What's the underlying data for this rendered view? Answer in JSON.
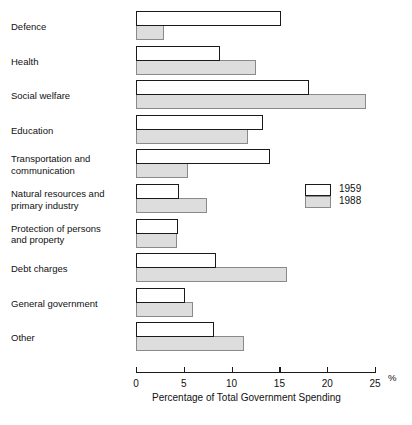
{
  "chart_data": {
    "type": "bar",
    "orientation": "horizontal",
    "title": "",
    "xlabel": "Percentage of Total Government Spending",
    "ylabel": "",
    "xlim": [
      0,
      25
    ],
    "xticks": [
      0,
      5,
      10,
      15,
      20,
      25
    ],
    "xtick_labels": [
      "0",
      "5",
      "10",
      "15",
      "20",
      "25"
    ],
    "unit_symbol": "%",
    "grid": false,
    "legend_position": "middle-right",
    "categories": [
      "Defence",
      "Health",
      "Social welfare",
      "Education",
      "Transportation and\ncommunication",
      "Natural resources and\nprimary industry",
      "Protection of persons\nand property",
      "Debt charges",
      "General government",
      "Other"
    ],
    "series": [
      {
        "name": "1959",
        "color": "#ffffff",
        "border_color": "#1a1a1a",
        "values": [
          15.2,
          8.8,
          18.1,
          13.3,
          14.0,
          4.5,
          4.4,
          8.4,
          5.1,
          8.2
        ]
      },
      {
        "name": "1988",
        "color": "#dddddd",
        "border_color": "#8a8a8a",
        "values": [
          2.9,
          12.6,
          24.1,
          11.7,
          5.4,
          7.4,
          4.3,
          15.8,
          6.0,
          11.3
        ]
      }
    ],
    "legend": [
      "1959",
      "1988"
    ]
  }
}
